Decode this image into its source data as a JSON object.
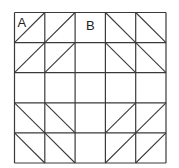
{
  "diagram": {
    "type": "grid",
    "rows": 5,
    "cols": 5,
    "origin": {
      "x": 14.5,
      "y": 12.5
    },
    "cell_width": 30.3,
    "cell_height": 30.1,
    "line_color": "#3a3a3a",
    "labels": [
      {
        "text": "A",
        "row": 0,
        "col": 0
      },
      {
        "text": "B",
        "row": 0,
        "col": 2
      }
    ],
    "diagonals": [
      [
        "/",
        "/",
        "",
        "\\",
        "\\"
      ],
      [
        "/",
        "/",
        "",
        "\\",
        "\\"
      ],
      [
        "",
        "",
        "",
        "",
        ""
      ],
      [
        "\\",
        "\\",
        "",
        "/",
        "/"
      ],
      [
        "\\",
        "\\",
        "",
        "/",
        "/"
      ]
    ]
  }
}
